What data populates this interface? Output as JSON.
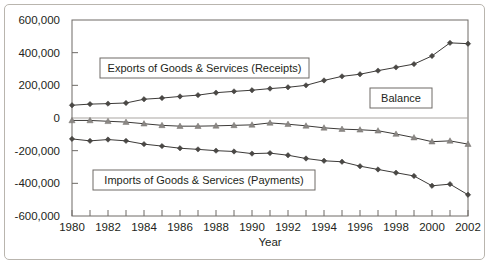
{
  "chart_data": {
    "type": "line",
    "title": "",
    "xlabel": "Year",
    "ylabel": "",
    "grid": false,
    "legend_position": "inline-callout",
    "xlim": [
      1980,
      2002
    ],
    "ylim": [
      -600000,
      600000
    ],
    "y_ticks": [
      600000,
      400000,
      200000,
      0,
      -200000,
      -400000,
      -600000
    ],
    "y_tick_labels": [
      "600,000",
      "400,000",
      "200,000",
      "0",
      "-200,000",
      "-400,000",
      "-600,000"
    ],
    "x_ticks": [
      1980,
      1981,
      1982,
      1983,
      1984,
      1985,
      1986,
      1987,
      1988,
      1989,
      1990,
      1991,
      1992,
      1993,
      1994,
      1995,
      1996,
      1997,
      1998,
      1999,
      2000,
      2001,
      2002
    ],
    "x_tick_labels": [
      "1980",
      "",
      "1982",
      "",
      "1984",
      "",
      "1986",
      "",
      "1988",
      "",
      "1990",
      "",
      "1992",
      "",
      "1994",
      "",
      "1996",
      "",
      "1998",
      "",
      "2000",
      "",
      "2002"
    ],
    "x": [
      1980,
      1981,
      1982,
      1983,
      1984,
      1985,
      1986,
      1987,
      1988,
      1989,
      1990,
      1991,
      1992,
      1993,
      1994,
      1995,
      1996,
      1997,
      1998,
      1999,
      2000,
      2001,
      2002
    ],
    "series": [
      {
        "name": "Exports of Goods & Services (Receipts)",
        "marker": "diamond",
        "color": "#3c3a38",
        "values": [
          78000,
          85000,
          88000,
          92000,
          115000,
          122000,
          132000,
          140000,
          155000,
          163000,
          170000,
          180000,
          188000,
          200000,
          230000,
          255000,
          268000,
          290000,
          310000,
          330000,
          380000,
          460000,
          455000
        ]
      },
      {
        "name": "Balance",
        "marker": "triangle",
        "color": "#8b8885",
        "values": [
          -15000,
          -15000,
          -20000,
          -25000,
          -35000,
          -45000,
          -50000,
          -50000,
          -48000,
          -45000,
          -42000,
          -30000,
          -38000,
          -48000,
          -60000,
          -68000,
          -72000,
          -78000,
          -98000,
          -120000,
          -145000,
          -140000,
          -160000
        ]
      },
      {
        "name": "Imports of Goods & Services (Payments)",
        "marker": "diamond",
        "color": "#3c3a38",
        "values": [
          -128000,
          -140000,
          -132000,
          -140000,
          -160000,
          -172000,
          -185000,
          -192000,
          -200000,
          -205000,
          -218000,
          -215000,
          -228000,
          -248000,
          -262000,
          -268000,
          -295000,
          -315000,
          -335000,
          -355000,
          -415000,
          -405000,
          -470000
        ]
      }
    ],
    "callouts": [
      {
        "label": "Exports of Goods & Services (Receipts)",
        "x": 100,
        "y": 58,
        "w": 209,
        "h": 20
      },
      {
        "label": "Balance",
        "x": 370,
        "y": 88,
        "w": 62,
        "h": 20
      },
      {
        "label": "Imports of Goods & Services (Payments)",
        "x": 93,
        "y": 170,
        "w": 222,
        "h": 20
      }
    ],
    "geometry": {
      "plot_left": 72,
      "plot_right": 468,
      "plot_top": 20,
      "plot_bottom": 216,
      "zero_y": 118
    }
  }
}
